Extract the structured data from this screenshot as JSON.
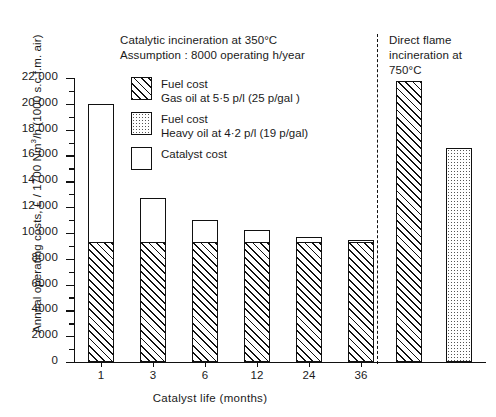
{
  "chart_data": {
    "type": "bar",
    "title_left": "Catalytic incineration at 350°C",
    "subtitle_left": "Assumption : 8000 operating h/year",
    "title_right_line1": "Direct flame",
    "title_right_line2": "incineration at 750°C",
    "xlabel": "Catalyst life  (months)",
    "ylabel_prefix": "Annual operating costs, £ / 1700 Nm",
    "ylabel_sup": "3",
    "ylabel_suffix": "/h (1000 s.c.f.m. air)",
    "ylim": [
      0,
      22000
    ],
    "ytick_step": 2000,
    "minor_tick_step": 1000,
    "grid": false,
    "categories": [
      "1",
      "3",
      "6",
      "12",
      "24",
      "36"
    ],
    "ytick_labels": [
      "0",
      "2000",
      "4000",
      "6000",
      "8000",
      "10 000",
      "12 000",
      "14 000",
      "16 000",
      "18 000",
      "20 000",
      "22 000"
    ],
    "series": [
      {
        "name": "Fuel cost Gas oil at 5·5 p/l (25 p/gal )",
        "pattern": "hatch",
        "values": [
          9200,
          9200,
          9200,
          9200,
          9200,
          9200
        ]
      },
      {
        "name": "Catalyst cost",
        "pattern": "open",
        "values": [
          10800,
          3500,
          1800,
          1000,
          500,
          250
        ]
      }
    ],
    "totals": [
      20000,
      12700,
      11000,
      10200,
      9700,
      9450
    ],
    "right_panel": {
      "categories": [
        "gas-oil",
        "heavy-oil"
      ],
      "values": [
        21800,
        16600
      ],
      "patterns": [
        "hatch",
        "dot"
      ]
    },
    "legend": [
      {
        "pattern": "hatch",
        "line1": "Fuel cost",
        "line2": "Gas oil at 5·5 p/l  (25 p/gal )"
      },
      {
        "pattern": "dot",
        "line1": "Fuel cost",
        "line2": "Heavy oil at 4·2 p/l  (19 p/gal)"
      },
      {
        "pattern": "open",
        "line1": "Catalyst cost",
        "line2": ""
      }
    ]
  }
}
